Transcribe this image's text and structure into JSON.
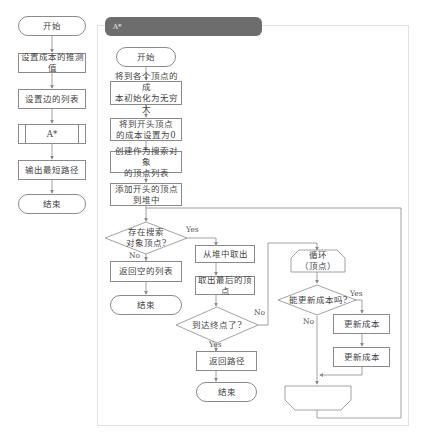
{
  "main_flow": {
    "start": "开始",
    "set_heuristic": "设置成本的推测值",
    "set_edges": "设置边的列表",
    "astar_call": "A*",
    "output_path": "输出最短路径",
    "end": "结束"
  },
  "astar_panel": {
    "title": "A*",
    "start": "开始",
    "init_costs": "将到各个顶点的成本初始化为无穷大",
    "init_costs_lines": [
      "将到各个顶点的成",
      "本初始化为无穷大"
    ],
    "start_cost_zero_lines": [
      "将到开头顶点",
      "的成本设置为0"
    ],
    "create_list_lines": [
      "创建作为搜索对象",
      "的顶点列表"
    ],
    "push_start_lines": [
      "添加开头的顶点",
      "到堆中"
    ],
    "exists_decision_lines": [
      "存在搜索",
      "对象顶点?"
    ],
    "return_empty": "返回空的列表",
    "end_left": "结束",
    "pop_heap": "从堆中取出",
    "take_last": "取出最后的顶点",
    "reached_goal": "到达终点了?",
    "return_path": "返回路径",
    "end_mid": "结束",
    "loop_start_lines": [
      "循环",
      "（顶点）"
    ],
    "can_update": "能更新成本吗?",
    "update_cost_1": "更新成本",
    "update_cost_2": "更新成本",
    "labels": {
      "yes_exists": "Yes",
      "no_exists": "No",
      "no_goal": "No",
      "yes_goal": "Yes",
      "yes_update": "Yes",
      "no_update": "No"
    }
  },
  "colors": {
    "stroke": "#8a8a8a",
    "header": "#6d6d6d",
    "panel_border": "#e2e2e2"
  }
}
